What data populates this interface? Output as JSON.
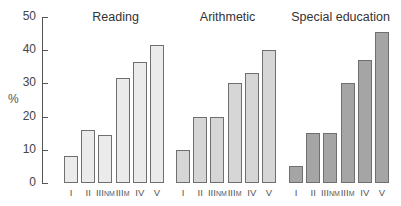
{
  "chart_data": [
    {
      "type": "bar",
      "title": "Reading",
      "categories": [
        "I",
        "II",
        "IIINM",
        "IIIM",
        "IV",
        "V"
      ],
      "values": [
        8,
        16,
        14.5,
        31.5,
        36.5,
        41.5
      ],
      "ylabel": "%",
      "ylim": [
        0,
        50
      ],
      "yticks": [
        0,
        10,
        20,
        30,
        40,
        50
      ],
      "bar_color": "#ebebeb"
    },
    {
      "type": "bar",
      "title": "Arithmetic",
      "categories": [
        "I",
        "II",
        "IIINM",
        "IIIM",
        "IV",
        "V"
      ],
      "values": [
        10,
        20,
        20,
        30,
        33,
        40
      ],
      "ylabel": "%",
      "ylim": [
        0,
        50
      ],
      "bar_color": "#d6d6d6"
    },
    {
      "type": "bar",
      "title": "Special education",
      "categories": [
        "I",
        "II",
        "IIINM",
        "IIIM",
        "IV",
        "V"
      ],
      "values": [
        5,
        15,
        15,
        30,
        37,
        45.5
      ],
      "ylabel": "%",
      "ylim": [
        0,
        50
      ],
      "bar_color": "#a5a5a5"
    }
  ],
  "axis": {
    "ylabel": "%",
    "ticks": [
      "0",
      "10",
      "20",
      "30",
      "40",
      "50"
    ]
  },
  "panels": [
    {
      "title": "Reading",
      "labels": [
        "I",
        "II",
        "III",
        "NM",
        "III",
        "M",
        "IV",
        "V"
      ]
    },
    {
      "title": "Arithmetic"
    },
    {
      "title": "Special education"
    }
  ]
}
